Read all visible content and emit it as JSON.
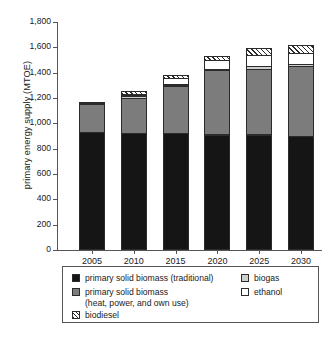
{
  "chart_data": {
    "type": "bar",
    "subtype": "stacked-vertical",
    "title": "",
    "xlabel": "",
    "ylabel": "primary energy supply (MTOE)",
    "categories": [
      "2005",
      "2010",
      "2015",
      "2020",
      "2025",
      "2030"
    ],
    "ylim": [
      0,
      1800
    ],
    "yticks": [
      0,
      200,
      400,
      600,
      800,
      1000,
      1200,
      1400,
      1600,
      1800
    ],
    "ytick_labels": [
      "0",
      "200",
      "400",
      "600",
      "800",
      "1,000",
      "1,200",
      "1,400",
      "1,600",
      "1,800"
    ],
    "grid": false,
    "legend_position": "below-plot",
    "series": [
      {
        "name": "primary solid biomass (traditional)",
        "key": "traditional",
        "color": "#151515",
        "pattern": "solid",
        "values": [
          930,
          925,
          920,
          910,
          910,
          900
        ]
      },
      {
        "name": "primary solid biomass (heat, power, and own use)",
        "key": "heatpower",
        "color": "#7c7c7c",
        "pattern": "solid",
        "values": [
          225,
          280,
          380,
          515,
          525,
          555
        ]
      },
      {
        "name": "biogas",
        "key": "biogas",
        "color": "#cfcfcf",
        "pattern": "solid",
        "values": [
          10,
          25,
          15,
          15,
          25,
          25
        ]
      },
      {
        "name": "ethanol",
        "key": "ethanol",
        "color": "#ffffff",
        "pattern": "solid",
        "values": [
          5,
          10,
          55,
          75,
          95,
          90
        ]
      },
      {
        "name": "biodiesel",
        "key": "biodiesel",
        "color": "#ffffff",
        "pattern": "diagonal-hatch",
        "values": [
          0,
          30,
          30,
          40,
          60,
          70
        ]
      }
    ],
    "totals": [
      1170,
      1270,
      1400,
      1555,
      1615,
      1640
    ]
  },
  "axis": {
    "y_title": "primary energy supply (MTOE)",
    "y_labels": [
      "0",
      "200",
      "400",
      "600",
      "800",
      "1,000",
      "1,200",
      "1,400",
      "1,600",
      "1,800"
    ],
    "x_labels": [
      "2005",
      "2010",
      "2015",
      "2020",
      "2025",
      "2030"
    ]
  },
  "legend": {
    "items": [
      {
        "label": "primary solid biomass (traditional)",
        "key": "traditional"
      },
      {
        "label": "primary solid biomass",
        "label_line2": "(heat, power, and own use)",
        "key": "heatpower"
      },
      {
        "label": "biodiesel",
        "key": "biodiesel"
      },
      {
        "label": "biogas",
        "key": "biogas"
      },
      {
        "label": "ethanol",
        "key": "ethanol"
      }
    ]
  },
  "caption_strip": ""
}
